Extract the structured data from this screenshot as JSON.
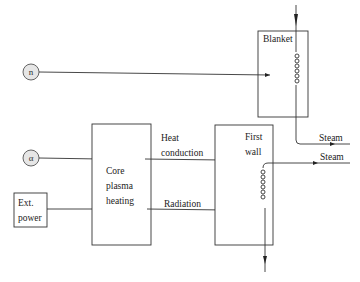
{
  "diagram": {
    "type": "energy-flow block diagram",
    "sources": [
      {
        "id": "neutron",
        "label": "n"
      },
      {
        "id": "alpha",
        "label": "α"
      },
      {
        "id": "ext_power",
        "label_line1": "Ext.",
        "label_line2": "power"
      }
    ],
    "blocks": {
      "core": {
        "line1": "Core",
        "line2": "plasma",
        "line3": "heating"
      },
      "first_wall": {
        "line1": "First",
        "line2": "wall"
      },
      "blanket": {
        "line1": "Blanket"
      }
    },
    "edges": {
      "heat_conduction": {
        "line1": "Heat",
        "line2": "conduction"
      },
      "radiation": {
        "label": "Radiation"
      }
    },
    "outputs": {
      "steam_blanket": "Steam",
      "steam_first_wall": "Steam"
    }
  }
}
